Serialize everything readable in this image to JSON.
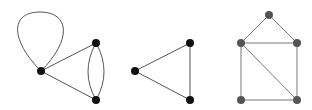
{
  "diagram": {
    "title": "",
    "background": "#ffffff",
    "graphs": [
      {
        "id": "graph-1",
        "description": "Multigraph with a loop and a double edge",
        "vertex_color": "#111111",
        "edge_color": "#555555",
        "vertex_radius": 4,
        "vertices": [
          {
            "id": "a",
            "x": 41,
            "y": 71
          },
          {
            "id": "b",
            "x": 96,
            "y": 43
          },
          {
            "id": "c",
            "x": 96,
            "y": 100
          }
        ],
        "edges": [
          {
            "id": "loop-a",
            "type": "loop",
            "from": "a",
            "to": "a",
            "path": "M41,71 C10,40 10,12 40,12 C70,12 72,40 41,71"
          },
          {
            "id": "a-b",
            "type": "line",
            "from": "a",
            "to": "b",
            "path": "M41,71 L96,43"
          },
          {
            "id": "a-c",
            "type": "line",
            "from": "a",
            "to": "c",
            "path": "M41,71 L96,100"
          },
          {
            "id": "b-c-1",
            "type": "curve",
            "from": "b",
            "to": "c",
            "path": "M96,43 Q80,71.5 96,100"
          },
          {
            "id": "b-c-2",
            "type": "curve",
            "from": "b",
            "to": "c",
            "path": "M96,43 Q112,71.5 96,100"
          }
        ]
      },
      {
        "id": "graph-2",
        "description": "Triangle (K3)",
        "vertex_color": "#111111",
        "edge_color": "#555555",
        "vertex_radius": 4,
        "vertices": [
          {
            "id": "a",
            "x": 135,
            "y": 71
          },
          {
            "id": "b",
            "x": 190,
            "y": 43
          },
          {
            "id": "c",
            "x": 190,
            "y": 100
          }
        ],
        "edges": [
          {
            "id": "a-b",
            "type": "line",
            "from": "a",
            "to": "b",
            "path": "M135,71 L190,43"
          },
          {
            "id": "a-c",
            "type": "line",
            "from": "a",
            "to": "c",
            "path": "M135,71 L190,100"
          },
          {
            "id": "b-c",
            "type": "line",
            "from": "b",
            "to": "c",
            "path": "M190,43 L190,100"
          }
        ]
      },
      {
        "id": "graph-3",
        "description": "House graph with a diagonal",
        "vertex_color": "#555555",
        "edge_color": "#777777",
        "vertex_radius": 4,
        "vertices": [
          {
            "id": "top",
            "x": 269,
            "y": 15
          },
          {
            "id": "ml",
            "x": 241,
            "y": 43
          },
          {
            "id": "mr",
            "x": 297,
            "y": 43
          },
          {
            "id": "bl",
            "x": 241,
            "y": 100
          },
          {
            "id": "br",
            "x": 297,
            "y": 100
          }
        ],
        "edges": [
          {
            "id": "top-ml",
            "type": "line",
            "from": "top",
            "to": "ml",
            "path": "M269,15 L241,43"
          },
          {
            "id": "top-mr",
            "type": "line",
            "from": "top",
            "to": "mr",
            "path": "M269,15 L297,43"
          },
          {
            "id": "ml-mr",
            "type": "line",
            "from": "ml",
            "to": "mr",
            "path": "M241,43 L297,43"
          },
          {
            "id": "ml-bl",
            "type": "line",
            "from": "ml",
            "to": "bl",
            "path": "M241,43 L241,100"
          },
          {
            "id": "mr-br",
            "type": "line",
            "from": "mr",
            "to": "br",
            "path": "M297,43 L297,100"
          },
          {
            "id": "bl-br",
            "type": "line",
            "from": "bl",
            "to": "br",
            "path": "M241,100 L297,100"
          },
          {
            "id": "ml-br",
            "type": "line",
            "from": "ml",
            "to": "br",
            "path": "M241,43 L297,100"
          }
        ]
      }
    ]
  }
}
